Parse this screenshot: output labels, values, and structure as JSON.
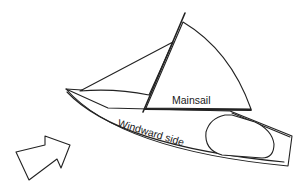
{
  "diagram": {
    "labels": {
      "mainsail": "Mainsail",
      "windward_side": "Windward side"
    },
    "elements": {
      "wind_arrow": "wind-direction-arrow",
      "hull": "boat-hull",
      "mast": "mast",
      "mainsail": "mainsail",
      "jib": "jib",
      "boom": "boom",
      "cockpit": "cockpit"
    },
    "colors": {
      "line": "#222222",
      "background": "#ffffff"
    }
  }
}
